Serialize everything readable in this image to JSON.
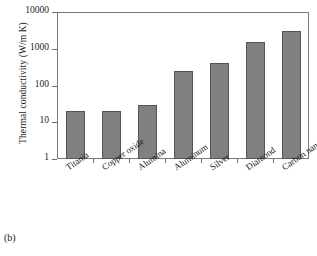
{
  "figure": {
    "panel_caption": "(b)",
    "bar_color": "#808080",
    "bar_edge_color": "#545454",
    "frame_color": "#7a7a7a"
  },
  "chart_data": {
    "type": "bar",
    "title": "",
    "xlabel": "",
    "ylabel": "Thermal conductivity (W/m K)",
    "yscale": "log",
    "ylim": [
      1,
      10000
    ],
    "ytick_labels": [
      "10000",
      "1000",
      "100",
      "10",
      "1"
    ],
    "ytick_values": [
      10000,
      1000,
      100,
      10,
      1
    ],
    "grid": false,
    "legend": "none",
    "categories": [
      "Titania",
      "Copper oxide",
      "Alumina",
      "Aluminum",
      "Silver",
      "Diamond",
      "Carbon nanotubes"
    ],
    "values": [
      20,
      20,
      30,
      250,
      420,
      1500,
      3000
    ]
  }
}
